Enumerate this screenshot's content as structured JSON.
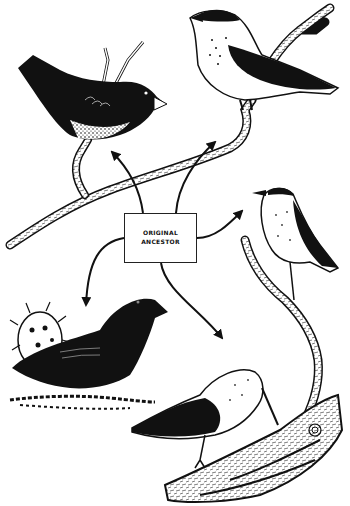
{
  "diagram": {
    "type": "adaptive-radiation-illustration",
    "center_label": {
      "line1": "ORIGINAL",
      "line2": "ANCESTOR"
    },
    "colors": {
      "ink": "#111111",
      "paper": "#ffffff"
    },
    "nodes": [
      {
        "id": "ancestor",
        "label": "ORIGINAL ANCESTOR"
      },
      {
        "id": "dark-finch-top-left",
        "description": "dark finch with speckled belly on branch"
      },
      {
        "id": "grosbeak-top-right",
        "description": "stout-billed finch with spotted breast on branch"
      },
      {
        "id": "warbler-finch-right",
        "description": "small thin-billed finch on twig"
      },
      {
        "id": "ground-finch-bottom-left",
        "description": "black ground finch beside cactus"
      },
      {
        "id": "woodpecker-finch-bottom-right",
        "description": "long-billed finch probing a log"
      }
    ],
    "arrows": [
      {
        "from": "ancestor",
        "to": "dark-finch-top-left"
      },
      {
        "from": "ancestor",
        "to": "grosbeak-top-right"
      },
      {
        "from": "ancestor",
        "to": "warbler-finch-right"
      },
      {
        "from": "ancestor",
        "to": "ground-finch-bottom-left"
      },
      {
        "from": "ancestor",
        "to": "woodpecker-finch-bottom-right"
      }
    ]
  }
}
